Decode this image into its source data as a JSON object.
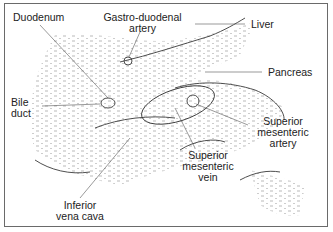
{
  "diagram": {
    "type": "anatomical cross-section sketch",
    "labels": {
      "duodenum": "Duodenum",
      "gastro_line1": "Gastro-duodenal",
      "gastro_line2": "artery",
      "liver": "Liver",
      "pancreas": "Pancreas",
      "bile_line1": "Bile",
      "bile_line2": "duct",
      "sma_line1": "Superior",
      "sma_line2": "mesenteric",
      "sma_line3": "artery",
      "smv_line1": "Superior",
      "smv_line2": "mesenteric",
      "smv_line3": "vein",
      "ivc_line1": "Inferior",
      "ivc_line2": "vena cava"
    },
    "colors": {
      "line": "#3a3a3a",
      "stipple": "#7a7a7a",
      "border": "#6a6a6a",
      "text": "#222222"
    }
  }
}
